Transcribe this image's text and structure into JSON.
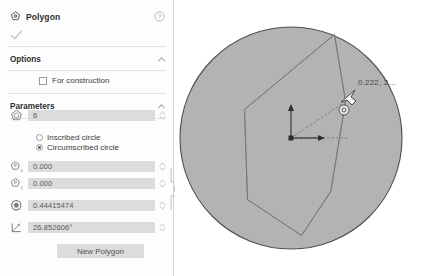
{
  "dialog": {
    "title": "Polygon",
    "title_icon": "polygon-tool-icon",
    "help_icon": "help-circle-icon",
    "confirm_icon": "checkmark-icon",
    "sections": {
      "options": {
        "label": "Options",
        "collapse_icon": "chevron-up-icon",
        "checkbox": {
          "label": "For construction",
          "checked": false
        }
      },
      "parameters": {
        "label": "Parameters",
        "collapse_icon": "chevron-up-icon",
        "fields": [
          {
            "name": "sides",
            "icon": "pentagon-sides-icon",
            "value": "6",
            "spinner_icon": "spinner-updown-icon"
          },
          {
            "name": "center-x",
            "icon": "pentagon-x-icon",
            "value": "0.000",
            "spinner_icon": "spinner-updown-icon"
          },
          {
            "name": "center-y",
            "icon": "pentagon-y-icon",
            "value": "0.000",
            "spinner_icon": "spinner-updown-icon"
          },
          {
            "name": "radius",
            "icon": "circle-radius-icon",
            "value": "0.44415474",
            "spinner_icon": "spinner-updown-icon"
          },
          {
            "name": "angle",
            "icon": "angle-icon",
            "value": "26.852606°",
            "spinner_icon": "spinner-updown-icon"
          }
        ],
        "radios": [
          {
            "label": "Inscribed circle",
            "selected": false
          },
          {
            "label": "Circumscribed circle",
            "selected": true
          }
        ]
      }
    },
    "new_polygon_button": "New Polygon",
    "resize_handle_icon": "panel-resize-handle-icon"
  },
  "canvas": {
    "coordinate_label": "0.222, 2…",
    "origin_icon": "origin-axes-icon",
    "cursor_icon": "cursor-arrow-icon",
    "cursor_badge_icon": "circle-constraint-badge-icon",
    "shape": {
      "type": "polygon-in-circumscribed-circle",
      "sides": 6,
      "circle_fill": "#b3b3b3",
      "circle_stroke": "#4f4f4f",
      "polygon_stroke": "#6e6e6e",
      "radius_line_style": "dashed"
    }
  },
  "colors": {
    "panel_bg": "#fdfdfd",
    "field_bg": "#dcdcdc",
    "canvas_bg": "#ffffff",
    "shape_fill": "#b3b3b3",
    "text": "#3a3a3a"
  }
}
